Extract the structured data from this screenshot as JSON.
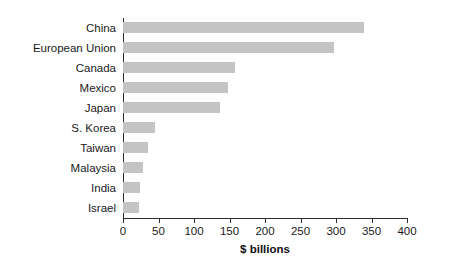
{
  "chart_data": {
    "type": "bar",
    "orientation": "horizontal",
    "title": "",
    "xlabel": "$ billions",
    "ylabel": "",
    "xlim": [
      0,
      400
    ],
    "xticks": [
      0,
      50,
      100,
      150,
      200,
      250,
      300,
      350,
      400
    ],
    "xtick_labels": [
      "0",
      "50",
      "100",
      "150",
      "200",
      "250",
      "300",
      "350",
      "400"
    ],
    "grid": false,
    "legend": false,
    "bar_color": "#c4c4c4",
    "axis_color": "#2b2b2b",
    "categories": [
      "China",
      "European Union",
      "Canada",
      "Mexico",
      "Japan",
      "S. Korea",
      "Taiwan",
      "Malaysia",
      "India",
      "Israel"
    ],
    "values": [
      340,
      297,
      158,
      148,
      137,
      45,
      35,
      28,
      24,
      22
    ]
  }
}
